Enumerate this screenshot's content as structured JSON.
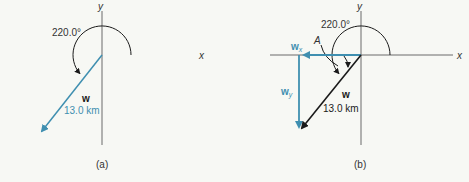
{
  "panels": [
    {
      "caption": "(a)",
      "x_label": "x",
      "y_label": "y",
      "angle_label": "220.0°",
      "vector_name": "w",
      "vector_magnitude": "13.0 km"
    },
    {
      "caption": "(b)",
      "x_label": "x",
      "y_label": "y",
      "angle_label": "220.0°",
      "angle_A": "A",
      "vector_name": "w",
      "vector_magnitude": "13.0 km",
      "component_x": "w",
      "component_x_sub": "x",
      "component_y": "w",
      "component_y_sub": "y"
    }
  ],
  "colors": {
    "axis": "#6b6b6b",
    "vector_blue": "#3f8fb0",
    "vector_black": "#1a1a1a",
    "text": "#333333",
    "background": "#f7f8f4"
  }
}
